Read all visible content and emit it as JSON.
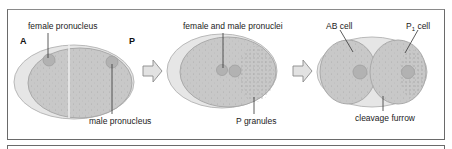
{
  "diagram": {
    "stage1": {
      "labels": {
        "anterior": "A",
        "posterior": "P",
        "female_pronucleus": "female pronucleus",
        "male_pronucleus": "male pronucleus"
      }
    },
    "stage2": {
      "labels": {
        "pronuclei": "female and male pronuclei",
        "p_granules": "P granules"
      }
    },
    "stage3": {
      "labels": {
        "ab_cell": "AB cell",
        "p1_cell_main": "P",
        "p1_cell_sub": "1",
        "p1_cell_suffix": " cell",
        "cleavage_furrow": "cleavage furrow"
      }
    },
    "colors": {
      "eggshell": "#e6e6e6",
      "eggshell_edge": "#b9b9b9",
      "cytoplasm": "#c8c8c8",
      "cytoplasm_edge": "#a9a9a9",
      "nucleus": "#b2b2b2",
      "arrow_fill": "#e2e2e2",
      "arrow_stroke": "#8a8a8a",
      "leader_line": "#333333"
    }
  }
}
